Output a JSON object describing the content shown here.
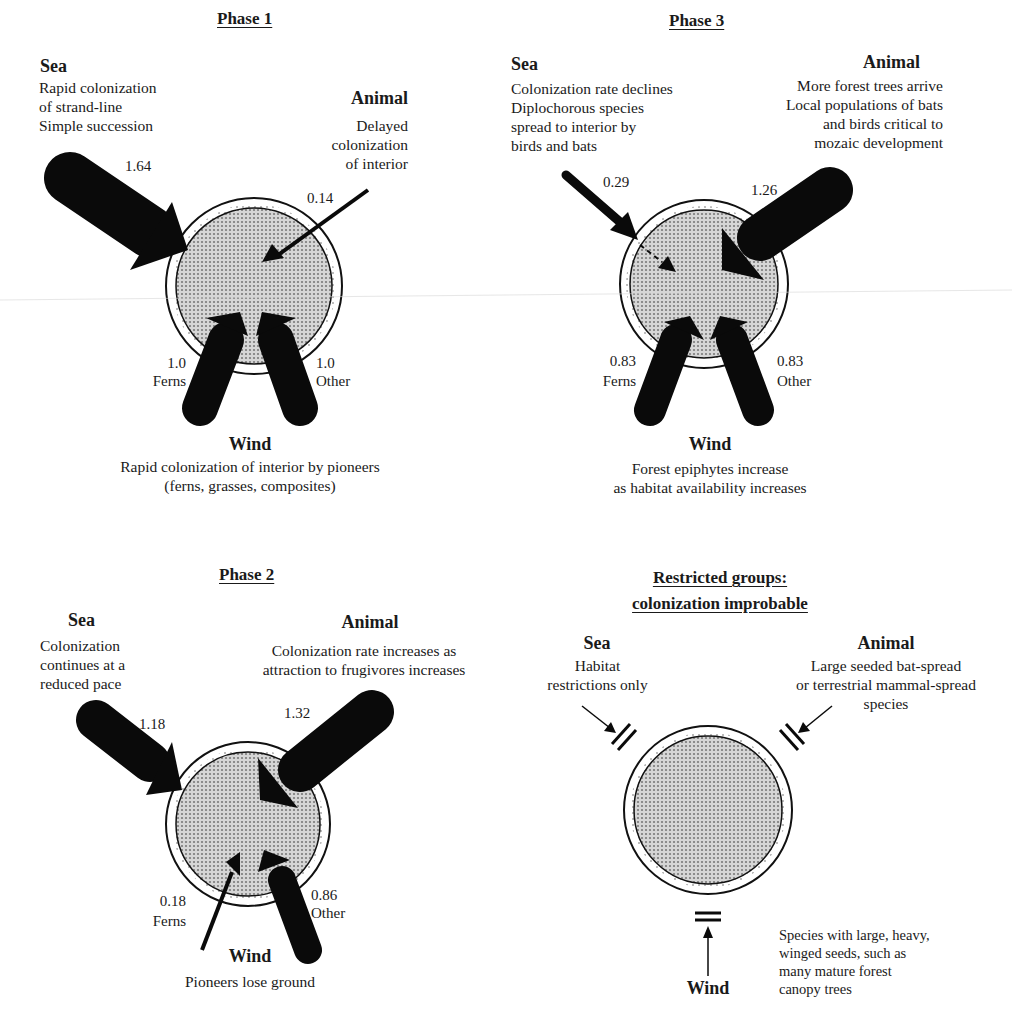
{
  "phases": {
    "phase1": {
      "title": "Phase 1",
      "sea": {
        "heading": "Sea",
        "description": "Rapid colonization\nof strand-line\nSimple succession",
        "value": "1.64"
      },
      "animal": {
        "heading": "Animal",
        "description": "Delayed\ncolonization\nof interior",
        "value": "0.14"
      },
      "wind": {
        "heading": "Wind",
        "description": "Rapid colonization of interior by pioneers\n(ferns, grasses, composites)",
        "ferns_value": "1.0",
        "ferns_label": "Ferns",
        "other_value": "1.0",
        "other_label": "Other"
      }
    },
    "phase2": {
      "title": "Phase 2",
      "sea": {
        "heading": "Sea",
        "description": "Colonization\ncontinues at a\nreduced pace",
        "value": "1.18"
      },
      "animal": {
        "heading": "Animal",
        "description": "Colonization rate increases as\nattraction to frugivores increases",
        "value": "1.32"
      },
      "wind": {
        "heading": "Wind",
        "description": "Pioneers lose ground",
        "ferns_value": "0.18",
        "ferns_label": "Ferns",
        "other_value": "0.86",
        "other_label": "Other"
      }
    },
    "phase3": {
      "title": "Phase 3",
      "sea": {
        "heading": "Sea",
        "description": "Colonization rate declines\nDiplochorous species\nspread to interior by\nbirds and bats",
        "value": "0.29"
      },
      "animal": {
        "heading": "Animal",
        "description": "More forest trees arrive\nLocal populations of bats\nand birds critical to\nmozaic development",
        "value": "1.26"
      },
      "wind": {
        "heading": "Wind",
        "description": "Forest epiphytes increase\nas habitat availability increases",
        "ferns_value": "0.83",
        "ferns_label": "Ferns",
        "other_value": "0.83",
        "other_label": "Other"
      }
    },
    "restricted": {
      "title_line1": "Restricted groups:",
      "title_line2": "colonization improbable",
      "sea": {
        "heading": "Sea",
        "description": "Habitat\nrestrictions only"
      },
      "animal": {
        "heading": "Animal",
        "description": "Large seeded bat-spread\nor terrestrial mammal-spread\nspecies"
      },
      "wind": {
        "heading": "Wind",
        "description": "Species with large, heavy,\nwinged seeds, such as\nmany mature forest\ncanopy trees"
      }
    }
  },
  "colors": {
    "arrow": "#0a0a0a",
    "island_fill": "#b8b8b8",
    "ring": "#ffffff",
    "text": "#1a1a1a"
  }
}
